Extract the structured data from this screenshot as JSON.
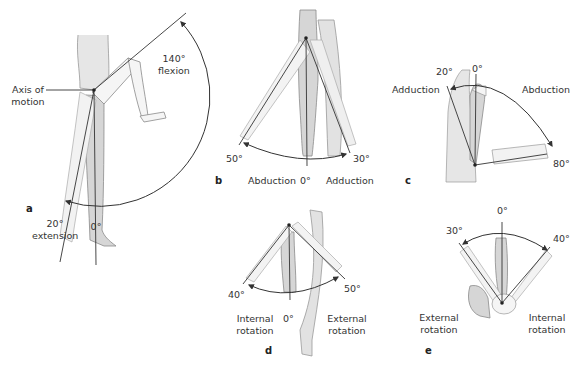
{
  "panels": {
    "a": {
      "letter": "a",
      "axis_label_1": "Axis of",
      "axis_label_2": "motion",
      "flexion_value": "140°",
      "flexion_label": "flexion",
      "extension_value": "20°",
      "extension_label": "extension",
      "neutral": "0°"
    },
    "b": {
      "letter": "b",
      "left_value": "50°",
      "right_value": "30°",
      "left_label": "Abduction",
      "neutral": "0°",
      "right_label": "Adduction"
    },
    "c": {
      "letter": "c",
      "adduction_value": "20°",
      "neutral": "0°",
      "adduction_label": "Adduction",
      "abduction_label": "Abduction",
      "abduction_value": "80°"
    },
    "d": {
      "letter": "d",
      "left_value": "40°",
      "right_value": "50°",
      "left_label_1": "Internal",
      "left_label_2": "rotation",
      "neutral": "0°",
      "right_label_1": "External",
      "right_label_2": "rotation"
    },
    "e": {
      "letter": "e",
      "neutral": "0°",
      "left_value": "30°",
      "right_value": "40°",
      "left_label_1": "External",
      "left_label_2": "rotation",
      "right_label_1": "Internal",
      "right_label_2": "rotation"
    }
  },
  "colors": {
    "line": "#333333",
    "limb_fill": "#d9d9d9",
    "limb_fill_light": "#eeeeee",
    "outline": "#8a8a8a"
  }
}
